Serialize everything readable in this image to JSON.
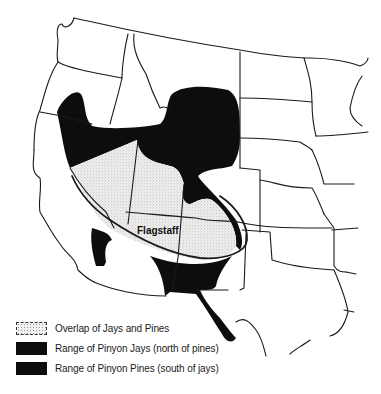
{
  "map": {
    "region": "Western United States",
    "city_label": "Flagstaff",
    "colors": {
      "range_fill": "#0d0d0d",
      "overlap_fill": "#efefef",
      "overlap_stipple": "#9a9a9a",
      "state_lines": "#1a1a1a",
      "background": "#ffffff"
    }
  },
  "legend": {
    "items": [
      {
        "key": "overlap",
        "label": "Overlap of Jays and Pines"
      },
      {
        "key": "jays",
        "label": "Range of Pinyon Jays (north of pines)"
      },
      {
        "key": "pines",
        "label": "Range of Pinyon Pines (south of jays)"
      }
    ]
  }
}
